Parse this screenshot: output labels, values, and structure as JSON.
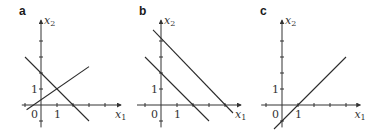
{
  "figure": {
    "panels": [
      {
        "id": "a",
        "label": "a",
        "origin_px": [
          41,
          105
        ],
        "unit_px": 16,
        "x_axis": {
          "label": "x",
          "sub": "1",
          "from": -1.2,
          "to": 5
        },
        "y_axis": {
          "label": "x",
          "sub": "2",
          "from": -1.4,
          "to": 5.3
        },
        "tick_labels": {
          "origin": "0",
          "x_one": "1",
          "y_one": "1"
        },
        "x_ticks": [
          -1,
          1,
          2,
          3,
          4
        ],
        "y_ticks": [
          -1,
          1,
          2,
          3,
          4
        ],
        "lines": [
          {
            "name": "line-x2-eq-2-minus-x1",
            "p1": [
              -1,
              3
            ],
            "p2": [
              3,
              -1
            ]
          },
          {
            "name": "line-increasing",
            "p1": [
              -0.9,
              -0.3
            ],
            "p2": [
              3,
              2.4
            ]
          }
        ]
      },
      {
        "id": "b",
        "label": "b",
        "origin_px": [
          161,
          105
        ],
        "unit_px": 16,
        "x_axis": {
          "label": "x",
          "sub": "1",
          "from": -1.5,
          "to": 5
        },
        "y_axis": {
          "label": "x",
          "sub": "2",
          "from": -1.4,
          "to": 5.3
        },
        "tick_labels": {
          "origin": "0",
          "x_one": "1",
          "y_one": "1"
        },
        "x_ticks": [
          -1,
          1,
          2,
          3,
          4
        ],
        "y_ticks": [
          -1,
          1,
          2,
          3,
          4
        ],
        "lines": [
          {
            "name": "line-x2-eq-4-minus-x1",
            "p1": [
              -0.5,
              4.7
            ],
            "p2": [
              4.5,
              -0.5
            ]
          },
          {
            "name": "line-x2-eq-2-minus-x1",
            "p1": [
              -1,
              3
            ],
            "p2": [
              3,
              -1
            ]
          }
        ]
      },
      {
        "id": "c",
        "label": "c",
        "origin_px": [
          282,
          105
        ],
        "unit_px": 16,
        "x_axis": {
          "label": "x",
          "sub": "1",
          "from": -1.3,
          "to": 4.9
        },
        "y_axis": {
          "label": "x",
          "sub": "2",
          "from": -1.4,
          "to": 5.3
        },
        "tick_labels": {
          "origin": "0",
          "x_one": "1",
          "y_one": "1"
        },
        "x_ticks": [
          -1,
          1,
          2,
          3,
          4
        ],
        "y_ticks": [
          -1,
          1,
          2,
          3,
          4
        ],
        "lines": [
          {
            "name": "line-x2-eq-x1-minus-1",
            "p1": [
              -0.5,
              -1.5
            ],
            "p2": [
              4,
              3
            ]
          }
        ]
      }
    ]
  }
}
